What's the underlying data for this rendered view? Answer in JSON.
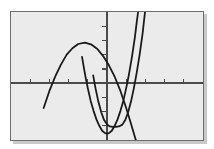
{
  "figure": {
    "title": "",
    "background_color": "#ffffff",
    "plot_background_color": "#ebebeb",
    "frame_color": "#6d6d6d",
    "curve_color": "#1a1a1a",
    "axis_color": "#4a4a4a"
  },
  "chart_data": {
    "type": "line",
    "title": "",
    "subtitle": "",
    "xlabel": "",
    "ylabel": "",
    "xlim": [
      -5,
      5
    ],
    "ylim": [
      -4,
      5
    ],
    "grid": false,
    "legend": "none",
    "axes": {
      "x_axis_visible": true,
      "y_axis_visible": true,
      "x_axis_y_value": 0,
      "y_axis_x_value": 0,
      "x_tick_interval": 1,
      "y_tick_interval": 1,
      "x_tick_values": [
        -4,
        -3,
        -2,
        -1,
        1,
        2,
        3,
        4
      ],
      "y_tick_values": [
        -3,
        -2,
        -1,
        1,
        2,
        3,
        4
      ],
      "tick_labels_shown": false
    },
    "series": [
      {
        "name": "downward-parabola",
        "kind": "quadratic",
        "opens": "down",
        "vertex": [
          -1.15,
          2.85
        ],
        "leading_coefficient": -1.0,
        "x_intercepts": [
          -2.85,
          0.55
        ],
        "points": [
          [
            -3.3,
            -1.75
          ],
          [
            -3.0,
            -0.55
          ],
          [
            -2.7,
            0.45
          ],
          [
            -2.4,
            1.3
          ],
          [
            -2.1,
            2.0
          ],
          [
            -1.8,
            2.45
          ],
          [
            -1.5,
            2.75
          ],
          [
            -1.15,
            2.85
          ],
          [
            -0.8,
            2.7
          ],
          [
            -0.5,
            2.4
          ],
          [
            -0.2,
            1.9
          ],
          [
            0.1,
            1.25
          ],
          [
            0.4,
            0.45
          ],
          [
            0.7,
            -0.55
          ],
          [
            1.0,
            -1.75
          ],
          [
            1.25,
            -2.85
          ],
          [
            1.5,
            -4.0
          ]
        ]
      },
      {
        "name": "upward-parabola-left",
        "kind": "quadratic",
        "opens": "up",
        "vertex": [
          0.0,
          -3.55
        ],
        "leading_coefficient": 3.2,
        "x_intercepts": [
          -1.05,
          1.05
        ],
        "points": [
          [
            -1.3,
            1.85
          ],
          [
            -1.2,
            1.05
          ],
          [
            -1.1,
            0.3
          ],
          [
            -1.0,
            -0.35
          ],
          [
            -0.85,
            -1.25
          ],
          [
            -0.7,
            -1.95
          ],
          [
            -0.55,
            -2.55
          ],
          [
            -0.4,
            -3.0
          ],
          [
            -0.25,
            -3.35
          ],
          [
            -0.1,
            -3.52
          ],
          [
            0.0,
            -3.55
          ],
          [
            0.1,
            -3.52
          ],
          [
            0.25,
            -3.35
          ],
          [
            0.4,
            -3.0
          ],
          [
            0.55,
            -2.55
          ],
          [
            0.7,
            -1.95
          ],
          [
            0.85,
            -1.25
          ],
          [
            1.0,
            -0.35
          ],
          [
            1.1,
            0.3
          ],
          [
            1.2,
            1.05
          ],
          [
            1.3,
            1.85
          ],
          [
            1.45,
            3.2
          ],
          [
            1.55,
            4.3
          ],
          [
            1.62,
            5.0
          ]
        ]
      },
      {
        "name": "upward-parabola-right",
        "kind": "quadratic",
        "opens": "up",
        "vertex": [
          0.62,
          -3.05
        ],
        "leading_coefficient": 3.2,
        "x_intercepts": [
          -0.35,
          1.6
        ],
        "points": [
          [
            -0.72,
            0.55
          ],
          [
            -0.6,
            -0.35
          ],
          [
            -0.45,
            -1.3
          ],
          [
            -0.3,
            -2.05
          ],
          [
            -0.15,
            -2.6
          ],
          [
            0.0,
            -2.9
          ],
          [
            0.15,
            -3.05
          ],
          [
            0.3,
            -3.08
          ],
          [
            0.45,
            -3.07
          ],
          [
            0.62,
            -3.05
          ],
          [
            0.8,
            -2.92
          ],
          [
            0.95,
            -2.6
          ],
          [
            1.1,
            -2.05
          ],
          [
            1.25,
            -1.3
          ],
          [
            1.4,
            -0.35
          ],
          [
            1.55,
            0.75
          ],
          [
            1.7,
            2.0
          ],
          [
            1.85,
            3.45
          ],
          [
            1.98,
            5.0
          ]
        ]
      }
    ]
  }
}
